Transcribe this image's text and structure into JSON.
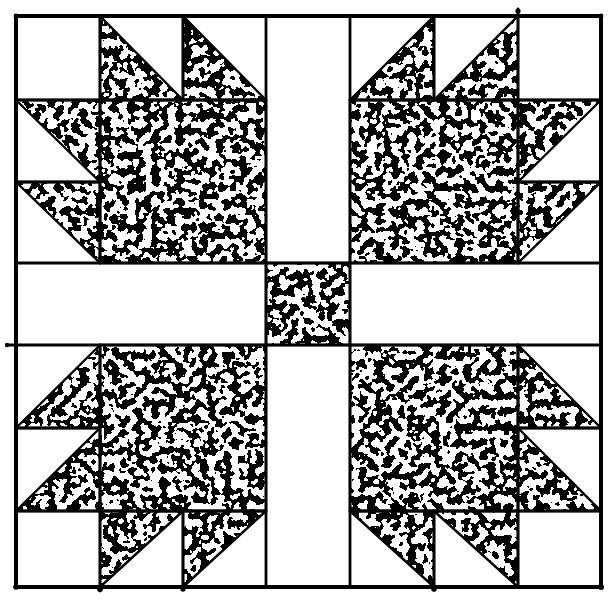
{
  "figure": {
    "kind": "quilt-block-line-drawing",
    "canvas": {
      "width": 613,
      "height": 602,
      "background": "#ffffff",
      "ink": "#000000"
    },
    "stipple": {
      "base_frequency": 0.125,
      "octaves": 2,
      "seed": 11,
      "table": "0 1"
    },
    "stroke": {
      "border_width": 4,
      "grid_width": 2.8,
      "edge_width": 2.4
    },
    "border": {
      "x": 16,
      "y": 16,
      "w": 585,
      "h": 571
    },
    "grid_lines": [
      [
        100,
        16,
        100,
        263
      ],
      [
        100,
        345,
        100,
        591
      ],
      [
        183,
        16,
        183,
        100
      ],
      [
        183,
        511,
        183,
        590
      ],
      [
        266,
        16,
        266,
        587
      ],
      [
        350,
        16,
        350,
        587
      ],
      [
        434,
        16,
        434,
        100
      ],
      [
        434,
        511,
        434,
        590
      ],
      [
        518,
        9,
        518,
        263
      ],
      [
        518,
        345,
        518,
        587
      ],
      [
        16,
        100,
        266,
        100
      ],
      [
        350,
        100,
        601,
        100
      ],
      [
        16,
        182,
        100,
        182
      ],
      [
        518,
        182,
        601,
        182
      ],
      [
        16,
        263,
        601,
        263
      ],
      [
        7,
        345,
        601,
        345
      ],
      [
        16,
        428,
        100,
        428
      ],
      [
        518,
        428,
        601,
        428
      ],
      [
        16,
        511,
        266,
        511
      ],
      [
        350,
        511,
        601,
        511
      ]
    ],
    "speckled_rects": [
      {
        "name": "paw-pad-top-left",
        "x": 100,
        "y": 100,
        "w": 166,
        "h": 163
      },
      {
        "name": "paw-pad-top-right",
        "x": 350,
        "y": 100,
        "w": 168,
        "h": 163
      },
      {
        "name": "paw-pad-bottom-left",
        "x": 100,
        "y": 345,
        "w": 166,
        "h": 166
      },
      {
        "name": "paw-pad-bottom-right",
        "x": 350,
        "y": 345,
        "w": 168,
        "h": 166
      },
      {
        "name": "center-square",
        "x": 266,
        "y": 263,
        "w": 84,
        "h": 82
      }
    ],
    "speckled_triangles": [
      {
        "name": "claw-top-left-paw-top-1",
        "points": [
          [
            100,
            16
          ],
          [
            100,
            100
          ],
          [
            183,
            100
          ]
        ]
      },
      {
        "name": "claw-top-left-paw-top-2",
        "points": [
          [
            183,
            16
          ],
          [
            183,
            100
          ],
          [
            266,
            100
          ]
        ]
      },
      {
        "name": "claw-top-left-paw-side-1",
        "points": [
          [
            16,
            100
          ],
          [
            100,
            100
          ],
          [
            100,
            182
          ]
        ]
      },
      {
        "name": "claw-top-left-paw-side-2",
        "points": [
          [
            16,
            182
          ],
          [
            100,
            182
          ],
          [
            100,
            263
          ]
        ]
      },
      {
        "name": "claw-top-right-paw-top-1",
        "points": [
          [
            434,
            16
          ],
          [
            434,
            100
          ],
          [
            350,
            100
          ]
        ]
      },
      {
        "name": "claw-top-right-paw-top-2",
        "points": [
          [
            518,
            16
          ],
          [
            518,
            100
          ],
          [
            434,
            100
          ]
        ]
      },
      {
        "name": "claw-top-right-paw-side-1",
        "points": [
          [
            518,
            100
          ],
          [
            601,
            100
          ],
          [
            518,
            182
          ]
        ]
      },
      {
        "name": "claw-top-right-paw-side-2",
        "points": [
          [
            518,
            182
          ],
          [
            601,
            182
          ],
          [
            518,
            263
          ]
        ]
      },
      {
        "name": "claw-bottom-left-paw-side-1",
        "points": [
          [
            100,
            345
          ],
          [
            100,
            428
          ],
          [
            16,
            428
          ]
        ]
      },
      {
        "name": "claw-bottom-left-paw-side-2",
        "points": [
          [
            100,
            428
          ],
          [
            100,
            511
          ],
          [
            16,
            511
          ]
        ]
      },
      {
        "name": "claw-bottom-left-paw-bot-1",
        "points": [
          [
            100,
            511
          ],
          [
            183,
            511
          ],
          [
            100,
            587
          ]
        ]
      },
      {
        "name": "claw-bottom-left-paw-bot-2",
        "points": [
          [
            183,
            511
          ],
          [
            266,
            511
          ],
          [
            183,
            587
          ]
        ]
      },
      {
        "name": "claw-bottom-right-paw-side-1",
        "points": [
          [
            518,
            345
          ],
          [
            518,
            428
          ],
          [
            601,
            428
          ]
        ]
      },
      {
        "name": "claw-bottom-right-paw-side-2",
        "points": [
          [
            518,
            428
          ],
          [
            518,
            511
          ],
          [
            601,
            511
          ]
        ]
      },
      {
        "name": "claw-bottom-right-paw-bot-1",
        "points": [
          [
            350,
            511
          ],
          [
            434,
            511
          ],
          [
            434,
            587
          ]
        ]
      },
      {
        "name": "claw-bottom-right-paw-bot-2",
        "points": [
          [
            434,
            511
          ],
          [
            518,
            511
          ],
          [
            518,
            587
          ]
        ]
      }
    ],
    "ink_dots": [
      {
        "x": 518,
        "y": 11,
        "r": 2.6
      },
      {
        "x": 100,
        "y": 589,
        "r": 3.0
      },
      {
        "x": 183,
        "y": 589,
        "r": 2.6
      },
      {
        "x": 434,
        "y": 589,
        "r": 2.8
      },
      {
        "x": 16,
        "y": 587,
        "r": 2.8
      },
      {
        "x": 601,
        "y": 587,
        "r": 3.0
      },
      {
        "x": 16,
        "y": 16,
        "r": 2.4
      },
      {
        "x": 601,
        "y": 16,
        "r": 2.4
      },
      {
        "x": 7,
        "y": 345,
        "r": 2.2
      }
    ]
  }
}
